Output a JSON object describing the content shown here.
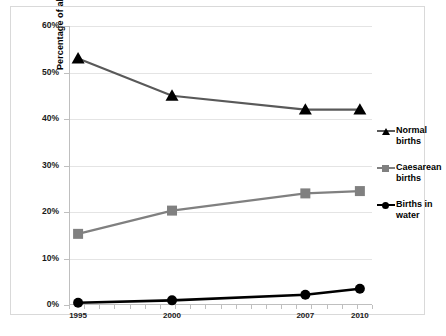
{
  "chart_data": {
    "type": "line",
    "title": "",
    "xlabel": "",
    "ylabel": "Percentage of all women giving birth",
    "categories": [
      "1995",
      "2000",
      "2007",
      "2010"
    ],
    "x_positions_pct": [
      3,
      34,
      78,
      96
    ],
    "ylim": [
      0,
      60
    ],
    "y_ticks": [
      "0%",
      "10%",
      "20%",
      "30%",
      "40%",
      "50%",
      "60%"
    ],
    "y_tick_values": [
      0,
      10,
      20,
      30,
      40,
      50,
      60
    ],
    "grid": true,
    "legend_position": "right",
    "series": [
      {
        "name": "Normal births",
        "label": "Normal births",
        "marker": "triangle",
        "color": "#595959",
        "marker_color": "#000000",
        "values": [
          53,
          45,
          42,
          42
        ]
      },
      {
        "name": "Caesarean births",
        "label": "Caesarean births",
        "marker": "square",
        "color": "#808080",
        "marker_color": "#808080",
        "values": [
          15.3,
          20.3,
          24,
          24.5
        ]
      },
      {
        "name": "Births in water",
        "label": "Births in water",
        "marker": "circle",
        "color": "#000000",
        "marker_color": "#000000",
        "values": [
          0.5,
          1.0,
          2.2,
          3.5
        ]
      }
    ]
  },
  "legend": {
    "items": [
      {
        "label_line1": "Normal",
        "label_line2": "births"
      },
      {
        "label_line1": "Caesarean",
        "label_line2": "births"
      },
      {
        "label_line1": "Births in",
        "label_line2": "water"
      }
    ]
  },
  "colors": {
    "normal_line": "#595959",
    "caesarean_line": "#808080",
    "water_line": "#000000",
    "grid": "#e4e4e4",
    "axis": "#bfbfbf",
    "frame": "#d9d9d9"
  }
}
